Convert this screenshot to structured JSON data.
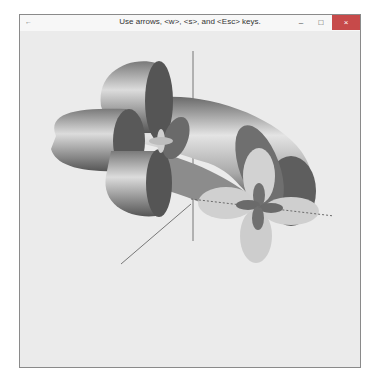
{
  "window": {
    "title": "Use arrows, <w>, <s>, and <Esc> keys.",
    "app_icon": "app-icon",
    "controls": {
      "minimize_label": "–",
      "maximize_label": "□",
      "close_label": "×"
    },
    "close_color": "#c74a4a",
    "background_color": "#ebebeb"
  },
  "scene": {
    "description": "3D rendered tube (torus segment) with cloverleaf (d-orbital) cross-sections at each end, with coordinate axes",
    "axes": [
      "x-axis-dashed",
      "y-axis-vertical",
      "z-axis-diagonal"
    ],
    "colors": {
      "tube_light": "#d8d8d8",
      "tube_mid": "#9a9a9a",
      "tube_dark": "#5a5a5a",
      "cap_light": "#cfcfcf",
      "cap_dark": "#606060",
      "axis": "#777777"
    }
  }
}
